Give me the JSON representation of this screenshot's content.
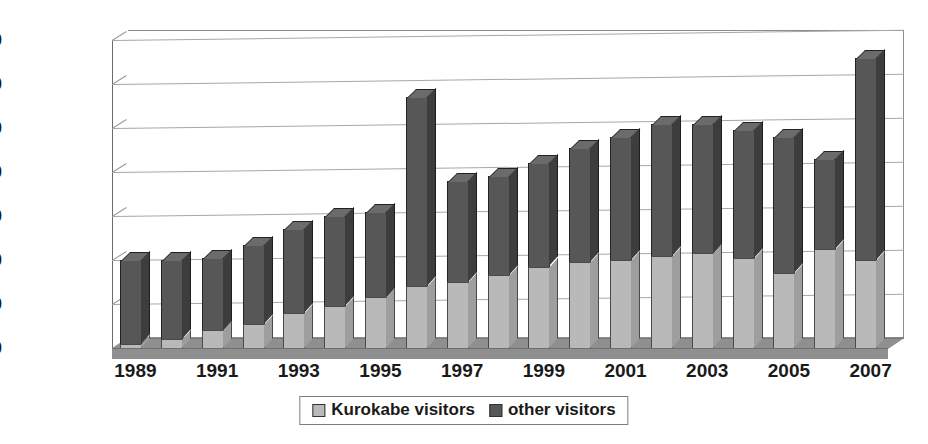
{
  "chart_data": {
    "type": "bar",
    "subtype": "stacked-column-3d",
    "title": "",
    "xlabel": "",
    "ylabel": "",
    "ylim": [
      0,
      7000
    ],
    "ytick_step": 1000,
    "ytick_labels": [
      "7,000",
      "6,000",
      "5,000",
      "4,000",
      "3,000",
      "2,000",
      "1,000",
      "0"
    ],
    "ytick_values": [
      7000,
      6000,
      5000,
      4000,
      3000,
      2000,
      1000,
      0
    ],
    "grid": true,
    "grid_axis": "y",
    "legend_position": "bottom-center",
    "categories": [
      "1989",
      "1990",
      "1991",
      "1992",
      "1993",
      "1994",
      "1995",
      "1996",
      "1997",
      "1998",
      "1999",
      "2000",
      "2001",
      "2002",
      "2003",
      "2004",
      "2005",
      "2006",
      "2007"
    ],
    "xtick_labels_shown": [
      "1989",
      "1991",
      "1993",
      "1995",
      "1997",
      "1999",
      "2001",
      "2003",
      "2005",
      "2007"
    ],
    "series": [
      {
        "name": "Kurokabe visitors",
        "color": "#b9b9b9",
        "values": [
          100,
          200,
          400,
          550,
          800,
          950,
          1150,
          1400,
          1500,
          1650,
          1850,
          1950,
          2000,
          2100,
          2150,
          2050,
          1700,
          2250,
          2000
        ]
      },
      {
        "name": "other visitors",
        "color": "#575757",
        "values": [
          1900,
          1800,
          1650,
          1800,
          1900,
          2050,
          1950,
          4300,
          2300,
          2250,
          2350,
          2600,
          2800,
          3000,
          2950,
          2900,
          3100,
          2050,
          4600
        ]
      }
    ],
    "totals": [
      2000,
      2000,
      2050,
      2350,
      2700,
      3000,
      3100,
      5700,
      3800,
      3900,
      4200,
      4550,
      4800,
      5100,
      5100,
      4950,
      4800,
      4300,
      6600
    ]
  },
  "legend": {
    "items": [
      {
        "label": "Kurokabe visitors",
        "swatch": "kurokabe-swatch"
      },
      {
        "label": "other visitors",
        "swatch": "other-swatch"
      }
    ]
  }
}
